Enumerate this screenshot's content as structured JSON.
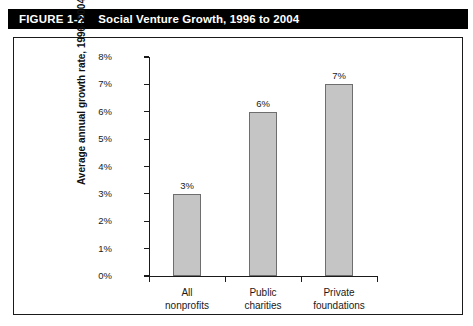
{
  "banner": {
    "figure_number": "FIGURE 1-2",
    "title": "Social Venture Growth, 1996 to 2004",
    "background_color": "#000000",
    "text_color": "#ffffff"
  },
  "chart_data": {
    "type": "bar",
    "title": "Social Venture Growth, 1996 to 2004",
    "categories": [
      "All nonprofits",
      "Public charities",
      "Private foundations"
    ],
    "category_lines": [
      [
        "All",
        "nonprofits"
      ],
      [
        "Public",
        "charities"
      ],
      [
        "Private",
        "foundations"
      ]
    ],
    "values": [
      3,
      6,
      7
    ],
    "data_labels": [
      "3%",
      "6%",
      "7%"
    ],
    "xlabel": "",
    "ylabel": "Average annual growth rate, 1996–2004",
    "ylim": [
      0,
      8
    ],
    "ytick_values": [
      0,
      1,
      2,
      3,
      4,
      5,
      6,
      7,
      8
    ],
    "ytick_labels": [
      "0%",
      "1%",
      "2%",
      "3%",
      "4%",
      "5%",
      "6%",
      "7%",
      "8%"
    ],
    "grid": false,
    "legend": false,
    "bar_fill_color": "#c5c5c5",
    "bar_border_color": "#6e6e6e",
    "axis_color": "#1a1a1a",
    "plot_background": "#ffffff"
  }
}
